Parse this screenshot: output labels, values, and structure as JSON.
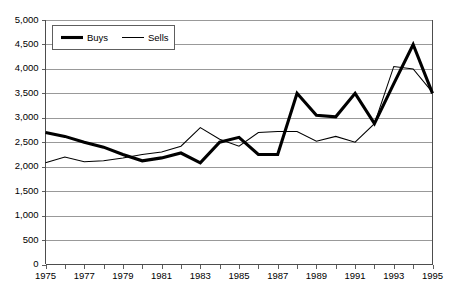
{
  "chart_data": {
    "type": "line",
    "title": "",
    "xlabel": "",
    "ylabel": "",
    "x": [
      1975,
      1976,
      1977,
      1978,
      1979,
      1980,
      1981,
      1982,
      1983,
      1984,
      1985,
      1986,
      1987,
      1988,
      1989,
      1990,
      1991,
      1992,
      1993,
      1994,
      1995
    ],
    "xlim": [
      1975,
      1995
    ],
    "ylim": [
      0,
      5000
    ],
    "grid": true,
    "legend_position": "top-left-inside",
    "x_tick_labels": [
      "1975",
      "1977",
      "1979",
      "1981",
      "1983",
      "1985",
      "1987",
      "1989",
      "1991",
      "1993",
      "1995"
    ],
    "x_tick_values": [
      1975,
      1977,
      1979,
      1981,
      1983,
      1985,
      1987,
      1989,
      1991,
      1993,
      1995
    ],
    "y_tick_labels": [
      "0",
      "500",
      "1,000",
      "1,500",
      "2,000",
      "2,500",
      "3,000",
      "3,500",
      "4,000",
      "4,500",
      "5,000"
    ],
    "y_tick_values": [
      0,
      500,
      1000,
      1500,
      2000,
      2500,
      3000,
      3500,
      4000,
      4500,
      5000
    ],
    "series": [
      {
        "name": "Buys",
        "style": "thick",
        "color": "#000000",
        "values": [
          2700,
          2620,
          2500,
          2400,
          2250,
          2120,
          2180,
          2280,
          2080,
          2500,
          2600,
          2250,
          2250,
          3500,
          3050,
          3020,
          3500,
          2880,
          3700,
          4500,
          3500
        ]
      },
      {
        "name": "Sells",
        "style": "thin",
        "color": "#000000",
        "values": [
          2080,
          2200,
          2100,
          2120,
          2180,
          2250,
          2300,
          2420,
          2800,
          2560,
          2420,
          2700,
          2720,
          2720,
          2520,
          2620,
          2500,
          2880,
          4050,
          4000,
          3520
        ]
      }
    ],
    "legend": [
      {
        "label": "Buys",
        "style": "thick"
      },
      {
        "label": "Sells",
        "style": "thin"
      }
    ]
  },
  "colors": {
    "background": "#ffffff",
    "gridline": "#808080",
    "axis": "#4d4d4d",
    "series": "#000000"
  }
}
